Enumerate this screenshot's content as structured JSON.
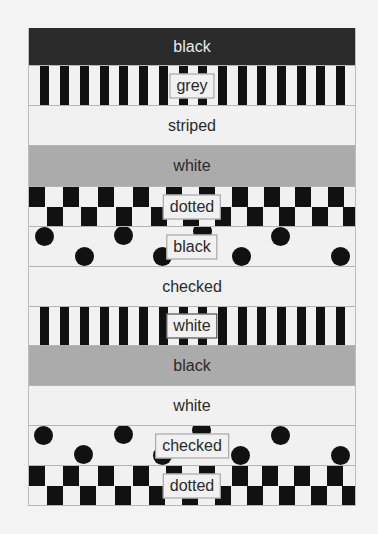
{
  "bands": [
    {
      "label": "black",
      "fill": "black",
      "pattern": "solid",
      "label_boxed": false
    },
    {
      "label": "grey",
      "fill": "white",
      "pattern": "striped",
      "label_boxed": true
    },
    {
      "label": "striped",
      "fill": "white",
      "pattern": "solid",
      "label_boxed": false
    },
    {
      "label": "white",
      "fill": "grey",
      "pattern": "solid",
      "label_boxed": false
    },
    {
      "label": "dotted",
      "fill": "white",
      "pattern": "checked",
      "label_boxed": true
    },
    {
      "label": "black",
      "fill": "white",
      "pattern": "dotted",
      "label_boxed": true
    },
    {
      "label": "checked",
      "fill": "white",
      "pattern": "solid",
      "label_boxed": false
    },
    {
      "label": "white",
      "fill": "white",
      "pattern": "striped",
      "label_boxed": true
    },
    {
      "label": "black",
      "fill": "grey",
      "pattern": "solid",
      "label_boxed": false
    },
    {
      "label": "white",
      "fill": "white",
      "pattern": "solid",
      "label_boxed": false
    },
    {
      "label": "checked",
      "fill": "white",
      "pattern": "dotted",
      "label_boxed": true
    },
    {
      "label": "dotted",
      "fill": "white",
      "pattern": "checked",
      "label_boxed": true
    }
  ],
  "colors": {
    "black": "#2b2b2b",
    "grey": "#ababab",
    "white": "#f1f1f1",
    "pattern": "#111111",
    "page": "#f3f3f3"
  }
}
